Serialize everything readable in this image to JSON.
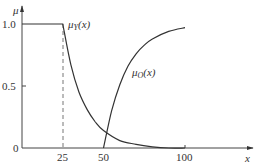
{
  "chart_data": {
    "type": "line",
    "title": "",
    "xlabel": "x",
    "ylabel": "μ",
    "xlim": [
      0,
      120
    ],
    "ylim": [
      0,
      1.0
    ],
    "x_ticks": [
      25,
      50,
      100
    ],
    "x_tick_labels": [
      "25",
      "50",
      "100"
    ],
    "y_ticks": [
      0,
      0.5,
      1.0
    ],
    "y_tick_labels": [
      "0",
      "0.5",
      "1.0"
    ],
    "grid": false,
    "annotations": [
      {
        "type": "dashed-vertical-line",
        "x": 25,
        "from_y": 0,
        "to_y": 1.0
      }
    ],
    "series": [
      {
        "name": "μY(x)",
        "label_main": "μ",
        "label_sub": "Y",
        "label_arg": "(x)",
        "x": [
          0,
          25,
          30,
          35,
          40,
          45,
          50,
          60,
          70,
          80,
          90,
          100
        ],
        "values": [
          1.0,
          1.0,
          0.67,
          0.45,
          0.31,
          0.21,
          0.14,
          0.06,
          0.03,
          0.01,
          0.0,
          0.0
        ]
      },
      {
        "name": "μO(x)",
        "label_main": "μ",
        "label_sub": "O",
        "label_arg": "(x)",
        "x": [
          50,
          55,
          60,
          65,
          70,
          75,
          80,
          90,
          100
        ],
        "values": [
          0.0,
          0.3,
          0.51,
          0.66,
          0.76,
          0.83,
          0.88,
          0.94,
          0.97
        ]
      }
    ]
  }
}
